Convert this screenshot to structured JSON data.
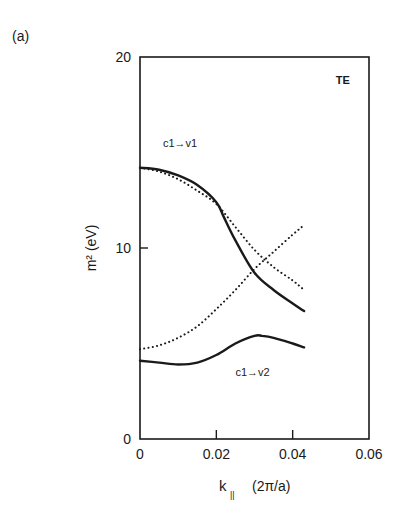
{
  "panel_label": "(a)",
  "chart_data": {
    "type": "line",
    "title": "",
    "panel_label": "(a)",
    "annotation_corner": "TE",
    "xlabel": "k_|| (2π/a)",
    "xlabel_main": "k",
    "xlabel_sub": "||",
    "xlabel_unit": "(2π/a)",
    "ylabel": "m² (eV)",
    "xlim": [
      0,
      0.06
    ],
    "ylim": [
      0,
      20
    ],
    "xticks": [
      0,
      0.02,
      0.04,
      0.06
    ],
    "xtick_labels": [
      "0",
      "0.02",
      "0.04",
      "0.06"
    ],
    "yticks": [
      0,
      10,
      20
    ],
    "ytick_labels": [
      "0",
      "10",
      "20"
    ],
    "grid": false,
    "legend": "none (inline labels)",
    "annotations": [
      {
        "text": "c1→v1",
        "x": 0.006,
        "y": 15.3
      },
      {
        "text": "c1→v2",
        "x": 0.025,
        "y": 3.3
      },
      {
        "text": "TE",
        "x": 0.055,
        "y": 18.6
      }
    ],
    "series": [
      {
        "name": "c1→v1 (solid)",
        "style": "solid",
        "x": [
          0,
          0.005,
          0.01,
          0.015,
          0.02,
          0.022,
          0.025,
          0.03,
          0.035,
          0.04,
          0.043
        ],
        "y": [
          14.2,
          14.1,
          13.8,
          13.3,
          12.4,
          11.6,
          10.4,
          8.7,
          7.8,
          7.1,
          6.7
        ]
      },
      {
        "name": "dotted (descending)",
        "style": "dotted",
        "x": [
          0,
          0.005,
          0.01,
          0.015,
          0.02,
          0.025,
          0.03,
          0.035,
          0.04,
          0.043
        ],
        "y": [
          14.2,
          14.0,
          13.6,
          13.0,
          12.3,
          11.1,
          9.9,
          9.0,
          8.3,
          7.8
        ]
      },
      {
        "name": "dotted (ascending)",
        "style": "dotted",
        "x": [
          0,
          0.005,
          0.01,
          0.015,
          0.02,
          0.025,
          0.03,
          0.035,
          0.04,
          0.043
        ],
        "y": [
          4.7,
          4.9,
          5.3,
          5.9,
          6.8,
          7.8,
          8.9,
          9.8,
          10.7,
          11.2
        ]
      },
      {
        "name": "c1→v2 (solid)",
        "style": "solid",
        "x": [
          0,
          0.005,
          0.01,
          0.015,
          0.02,
          0.025,
          0.03,
          0.032,
          0.035,
          0.04,
          0.043
        ],
        "y": [
          4.1,
          4.0,
          3.9,
          4.0,
          4.4,
          5.0,
          5.4,
          5.4,
          5.3,
          5.0,
          4.8
        ]
      }
    ]
  }
}
